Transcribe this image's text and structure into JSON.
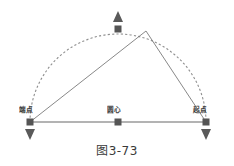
{
  "figure": {
    "caption": "图3-73",
    "type": "cad-arc-grip-editing-diagram",
    "background_color": "#ffffff"
  },
  "colors": {
    "grip_square": "#555555",
    "grip_arrow": "#5a5a5a",
    "arc_dashed": "#8f8f8f",
    "baseline": "#9a9a9a",
    "rubber_band": "#7a7a7a",
    "label_text": "#3b3b3b",
    "caption_text": "#3a3a3a"
  },
  "labels": {
    "endpoint": "端点",
    "center": "圆心",
    "startpoint": "起点"
  },
  "geometry": {
    "left_endpoint": {
      "x": 30,
      "y": 122
    },
    "right_endpoint": {
      "x": 206,
      "y": 122
    },
    "center_grip": {
      "x": 118,
      "y": 122
    },
    "midpoint_grip": {
      "x": 118,
      "y": 29
    },
    "cursor_apex": {
      "x": 146,
      "y": 31
    },
    "arc_radius": 88,
    "baseline_y": 122,
    "grip_size": 7
  },
  "grips": [
    {
      "name": "left-endpoint-grip",
      "x": 30,
      "y": 122,
      "shape": "square",
      "label": "端点"
    },
    {
      "name": "center-grip",
      "x": 118,
      "y": 122,
      "shape": "square",
      "label": "圆心"
    },
    {
      "name": "right-endpoint-grip",
      "x": 206,
      "y": 122,
      "shape": "square",
      "label": "起点"
    },
    {
      "name": "midpoint-grip",
      "x": 118,
      "y": 29,
      "shape": "square",
      "label": ""
    }
  ],
  "arrow_grips": [
    {
      "name": "midpoint-up-arrow-grip",
      "x": 118,
      "y": 18,
      "direction": "up"
    },
    {
      "name": "left-endpoint-down-arrow-grip",
      "x": 30,
      "y": 133,
      "direction": "down"
    },
    {
      "name": "right-endpoint-down-arrow-grip",
      "x": 206,
      "y": 133,
      "direction": "down"
    }
  ]
}
